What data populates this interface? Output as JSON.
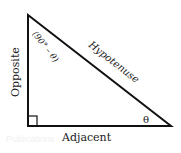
{
  "diagram": {
    "type": "right-triangle",
    "labels": {
      "opposite": "Opposite",
      "adjacent": "Adjacent",
      "hypotenuse": "Hypotenuse",
      "theta": "θ",
      "complement_angle": "(90° – θ)"
    },
    "watermark": "Publications",
    "colors": {
      "stroke": "#111111",
      "text": "#1a1a1a",
      "watermark": "#f0f0f0"
    }
  }
}
